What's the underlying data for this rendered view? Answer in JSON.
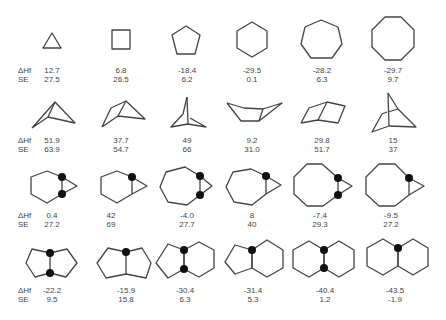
{
  "row_labels": {
    "dhf": "ΔHf",
    "se": "SE"
  },
  "rows": [
    {
      "name": "monocyclic-rings",
      "items": [
        {
          "shape": "cyclopropane",
          "dhf": "12.7",
          "se": "27.5"
        },
        {
          "shape": "cyclobutane",
          "dhf": "6.8",
          "se": "26.5"
        },
        {
          "shape": "cyclopentane",
          "dhf": "-18.4",
          "se": "6.2"
        },
        {
          "shape": "cyclohexane",
          "dhf": "-29.5",
          "se": "0.1"
        },
        {
          "shape": "cycloheptane",
          "dhf": "-28.2",
          "se": "6.3"
        },
        {
          "shape": "cyclooctane",
          "dhf": "-29.7",
          "se": "9.7"
        }
      ]
    },
    {
      "name": "bicyclic-bridged",
      "items": [
        {
          "shape": "bicyclo[1.1.0]butane",
          "dhf": "51.9",
          "se": "63.9"
        },
        {
          "shape": "bicyclo[2.1.0]pentane",
          "dhf": "37.7",
          "se": "54.7"
        },
        {
          "shape": "bicyclo[1.1.1]pentane",
          "dhf": "49",
          "se": "66"
        },
        {
          "shape": "bicyclo[4.1.0]heptane-perspective",
          "dhf": "9.2",
          "se": "31.0"
        },
        {
          "shape": "bicyclo[2.2.0]hexane",
          "dhf": "29.8",
          "se": "51.7"
        },
        {
          "shape": "bicyclo[2.1.1]hexane",
          "dhf": "15",
          "se": "37"
        }
      ]
    },
    {
      "name": "fused-cyclopropanes",
      "items": [
        {
          "shape": "cis-bicyclo[4.1.0]heptane",
          "dhf": "0.4",
          "se": "27.2"
        },
        {
          "shape": "trans-bicyclo[4.1.0]heptane",
          "dhf": "42",
          "se": "69"
        },
        {
          "shape": "cis-bicyclo[5.1.0]octane",
          "dhf": "-4.0",
          "se": "27.7"
        },
        {
          "shape": "trans-bicyclo[5.1.0]octane",
          "dhf": "8",
          "se": "40"
        },
        {
          "shape": "cis-bicyclo[6.1.0]nonane",
          "dhf": "-7.4",
          "se": "29.3"
        },
        {
          "shape": "trans-bicyclo[6.1.0]nonane",
          "dhf": "-9.5",
          "se": "27.2"
        }
      ]
    },
    {
      "name": "fused-bicyclics",
      "items": [
        {
          "shape": "cis-bicyclo[3.3.0]octane",
          "dhf": "-22.2",
          "se": "9.5"
        },
        {
          "shape": "trans-bicyclo[3.3.0]octane",
          "dhf": "-15.9",
          "se": "15.8"
        },
        {
          "shape": "cis-hydrindane",
          "dhf": "-30.4",
          "se": "6.3"
        },
        {
          "shape": "trans-hydrindane",
          "dhf": "-31.4",
          "se": "5.3"
        },
        {
          "shape": "cis-decalin",
          "dhf": "-40.4",
          "se": "1.2"
        },
        {
          "shape": "trans-decalin",
          "dhf": "-43.5",
          "se": "-1.9"
        }
      ]
    }
  ]
}
